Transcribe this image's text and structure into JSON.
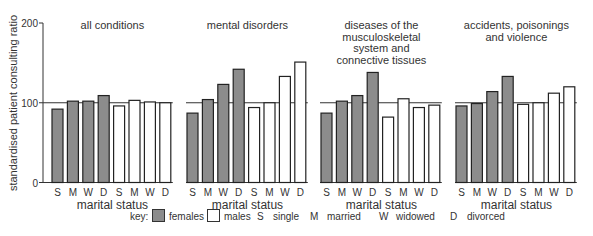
{
  "chart_data": {
    "type": "bar",
    "ylabel": "standardised patient consulting ratio",
    "xlabel": "marital status",
    "yticks": [
      0,
      100,
      200
    ],
    "ylim": [
      0,
      200
    ],
    "reference_line": 100,
    "categories": [
      "S",
      "M",
      "W",
      "D"
    ],
    "colors": {
      "females": "#8c8c8c",
      "males": "#ffffff"
    },
    "panels": [
      {
        "title": [
          "all conditions"
        ],
        "series": [
          {
            "name": "females",
            "values": [
              92,
              102,
              102,
              109
            ]
          },
          {
            "name": "males",
            "values": [
              96,
              103,
              101,
              100
            ]
          }
        ]
      },
      {
        "title": [
          "mental disorders"
        ],
        "series": [
          {
            "name": "females",
            "values": [
              87,
              104,
              123,
              142
            ]
          },
          {
            "name": "males",
            "values": [
              94,
              100,
              133,
              151
            ]
          }
        ]
      },
      {
        "title": [
          "diseases of the",
          "musculoskeletal",
          "system and",
          "connective tissues"
        ],
        "series": [
          {
            "name": "females",
            "values": [
              87,
              102,
              109,
              138
            ]
          },
          {
            "name": "males",
            "values": [
              82,
              105,
              94,
              97
            ]
          }
        ]
      },
      {
        "title": [
          "accidents, poisonings",
          "and violence"
        ],
        "series": [
          {
            "name": "females",
            "values": [
              96,
              99,
              114,
              133
            ]
          },
          {
            "name": "males",
            "values": [
              98,
              100,
              112,
              120
            ]
          }
        ]
      }
    ]
  },
  "key": {
    "label": "key:",
    "females": "females",
    "males": "males",
    "abbreviations": [
      {
        "code": "S",
        "text": "single"
      },
      {
        "code": "M",
        "text": "married"
      },
      {
        "code": "W",
        "text": "widowed"
      },
      {
        "code": "D",
        "text": "divorced"
      }
    ]
  }
}
